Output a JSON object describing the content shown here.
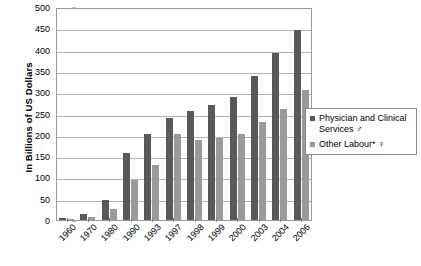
{
  "chart_data": {
    "type": "bar",
    "title": "",
    "xlabel": "",
    "ylabel": "In Billions of US Dollars",
    "ylim": [
      0,
      500
    ],
    "ytick_step": 50,
    "yticks": [
      0,
      50,
      100,
      150,
      200,
      250,
      300,
      350,
      400,
      450,
      500
    ],
    "grid": true,
    "legend_position": "right",
    "categories": [
      "1960",
      "1970",
      "1980",
      "1990",
      "1993",
      "1997",
      "1998",
      "1999",
      "2000",
      "2003",
      "2004",
      "2006"
    ],
    "series": [
      {
        "name": "Physician and Clinical Services ♂",
        "color": "#595959",
        "values": [
          5,
          14,
          47,
          157,
          201,
          240,
          255,
          269,
          288,
          337,
          393,
          447
        ]
      },
      {
        "name": "Other Labour* ♀",
        "color": "#9a9a9a",
        "values": [
          3,
          6,
          27,
          93,
          128,
          201,
          188,
          193,
          202,
          229,
          260,
          305
        ]
      }
    ]
  },
  "axis": {
    "y_title": "In Billions of US Dollars"
  },
  "legend": {
    "items": [
      {
        "label": "Physician and Clinical Services ♂",
        "color": "#595959"
      },
      {
        "label": "Other Labour* ♀",
        "color": "#9a9a9a"
      }
    ]
  },
  "colors": {
    "series_a": "#595959",
    "series_b": "#9a9a9a",
    "gridline": "#b5b5b5",
    "frame": "#9a9a9a",
    "background": "#ffffff"
  }
}
